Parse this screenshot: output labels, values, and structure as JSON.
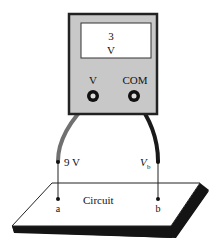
{
  "meter": {
    "reading_value": "3",
    "reading_unit": "V",
    "terminal_v_label": "V",
    "terminal_com_label": "COM"
  },
  "probes": {
    "left_label": "9 V",
    "right_label_main": "V",
    "right_label_sub": "b"
  },
  "circuit": {
    "label": "Circuit",
    "node_a": "a",
    "node_b": "b"
  },
  "colors": {
    "meter_body": "#c8c8c8",
    "meter_outline": "#222222",
    "display_bg": "#ffffff",
    "lead_red": "#707070",
    "lead_black": "#1a1a1a",
    "board_top": "#ffffff",
    "board_edge": "#141414"
  }
}
